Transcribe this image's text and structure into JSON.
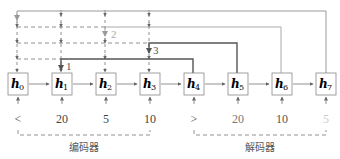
{
  "nodes": [
    {
      "label": "h",
      "sub": "0"
    },
    {
      "label": "h",
      "sub": "1"
    },
    {
      "label": "h",
      "sub": "2"
    },
    {
      "label": "h",
      "sub": "3"
    },
    {
      "label": "h",
      "sub": "4"
    },
    {
      "label": "h",
      "sub": "5"
    },
    {
      "label": "h",
      "sub": "6"
    },
    {
      "label": "h",
      "sub": "7"
    }
  ],
  "inputs": [
    "<",
    "20",
    "5",
    "10",
    ">",
    "20",
    "10",
    "5"
  ],
  "groups": {
    "encoder": "编码器",
    "decoder": "解码器"
  },
  "attention_steps": {
    "step1": "1",
    "step2": "2",
    "step3": "3"
  },
  "colors": {
    "dark": "#555555",
    "mid": "#888888",
    "light": "#aaaaaa",
    "faint": "#cccccc"
  }
}
